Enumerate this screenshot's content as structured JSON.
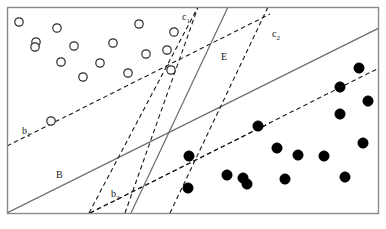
{
  "figure": {
    "background_color": "#ffffff",
    "frame": {
      "x": 7,
      "y": 7,
      "width": 372,
      "height": 207,
      "stroke": "#8a8a8a",
      "stroke_width": 1.4,
      "fill": "#ffffff"
    },
    "colors": {
      "line": "#6b6b6b",
      "dashed": "#1a1a1a",
      "open_marker_stroke": "#2b2b2b",
      "filled_marker": "#000000",
      "label_text": "#1a1a1a",
      "frame_stroke": "#8a8a8a"
    }
  },
  "chart_data": {
    "type": "scatter",
    "title": "",
    "xlabel": "",
    "ylabel": "",
    "xlim": [
      0,
      386
    ],
    "ylim": [
      229,
      0
    ],
    "grid": false,
    "legend": "none",
    "note": "Two-class scatter in pixel coordinates with origin at top-left; open circles are the negative/positive class on the upper-left, filled dots the other class on the lower-right. Six boundary lines (three solid, four dashed) separate the classes.",
    "series": [
      {
        "name": "open-circles",
        "marker": "open-circle",
        "marker_radius": 4.2,
        "count": 16,
        "points": [
          [
            19,
            22
          ],
          [
            57,
            28
          ],
          [
            36,
            42
          ],
          [
            74,
            46
          ],
          [
            139,
            24
          ],
          [
            61,
            62
          ],
          [
            100,
            63
          ],
          [
            174,
            32
          ],
          [
            113,
            43
          ],
          [
            146,
            54
          ],
          [
            83,
            77
          ],
          [
            167,
            50
          ],
          [
            128,
            73
          ],
          [
            171,
            70
          ],
          [
            51,
            121
          ],
          [
            35,
            47
          ]
        ]
      },
      {
        "name": "filled-dots",
        "marker": "filled-circle",
        "marker_radius": 5.2,
        "count": 16,
        "points": [
          [
            359,
            68
          ],
          [
            340,
            87
          ],
          [
            368,
            101
          ],
          [
            258,
            126
          ],
          [
            340,
            114
          ],
          [
            277,
            148
          ],
          [
            189,
            156
          ],
          [
            324,
            156
          ],
          [
            298,
            155
          ],
          [
            363,
            143
          ],
          [
            227,
            175
          ],
          [
            285,
            179
          ],
          [
            247,
            184
          ],
          [
            345,
            177
          ],
          [
            243,
            178
          ],
          [
            188,
            188
          ]
        ]
      }
    ],
    "boundaries": [
      {
        "id": "b1",
        "label": "b₁",
        "style": "dashed",
        "label_x": 22,
        "label_y": 134,
        "x1": 7,
        "y1": 146,
        "x2": 270,
        "y2": 14
      },
      {
        "id": "B",
        "label": "B",
        "style": "solid",
        "label_x": 56,
        "label_y": 178,
        "x1": 7,
        "y1": 213,
        "x2": 379,
        "y2": 28
      },
      {
        "id": "b2",
        "label": "b₂",
        "style": "dashed",
        "label_x": 111,
        "label_y": 197,
        "x1": 90,
        "y1": 213,
        "x2": 379,
        "y2": 68
      },
      {
        "id": "c1",
        "label": "c₁",
        "style": "dashed",
        "label_x": 182,
        "label_y": 20,
        "x1": 89,
        "y1": 213,
        "x2": 198,
        "y2": 7
      },
      {
        "id": "E",
        "label": "E",
        "style": "solid",
        "label_x": 221,
        "label_y": 60,
        "x1": 131,
        "y1": 213,
        "x2": 228,
        "y2": 7
      },
      {
        "id": "c2",
        "label": "c₂",
        "style": "dashed",
        "label_x": 272,
        "label_y": 37,
        "x1": 170,
        "y1": 213,
        "x2": 268,
        "y2": 7
      }
    ],
    "extra_segments": [
      {
        "id": "c1-lower-fan",
        "style": "dashed",
        "x1": 125,
        "y1": 213,
        "x2": 198,
        "y2": 7
      },
      {
        "id": "b2-lower-fan",
        "style": "dashed",
        "x1": 90,
        "y1": 213,
        "x2": 270,
        "y2": 123
      }
    ],
    "labels": [
      "b₁",
      "B",
      "b₂",
      "c₁",
      "E",
      "c₂"
    ]
  }
}
